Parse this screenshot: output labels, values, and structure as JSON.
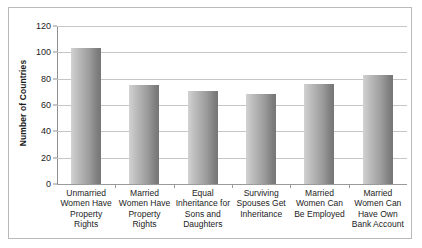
{
  "chart_data": {
    "type": "bar",
    "title": "",
    "subtitle": "",
    "xlabel": "",
    "ylabel": "Number of Countries",
    "ylim": [
      0,
      120
    ],
    "yticks": [
      0,
      20,
      40,
      60,
      80,
      100,
      120
    ],
    "grid": true,
    "legend": false,
    "legend_position": "none",
    "categories": [
      "Unmarried Women Have Property Rights",
      "Married Women Have Property Rights",
      "Equal Inheritance for Sons and Daughters",
      "Surviving Spouses Get Inheritance",
      "Married Women Can Be Employed",
      "Married Women Can Have Own Bank Account"
    ],
    "values": [
      103,
      75,
      71,
      68,
      76,
      83
    ],
    "bar_color_light": "#d2d2d2",
    "bar_color_dark": "#767676",
    "gridline_color": "#c6c6c6",
    "axis_color": "#8f8f8f",
    "border_color": "#b9b9b9",
    "background_color": "#ffffff"
  }
}
